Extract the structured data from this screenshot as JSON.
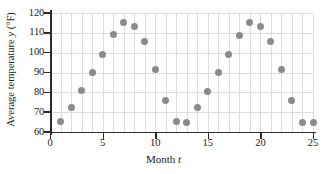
{
  "chart_data": {
    "type": "scatter",
    "title": "",
    "xlabel": "Month t",
    "ylabel": "Average temperature y (°F)",
    "xlim": [
      0,
      25
    ],
    "ylim": [
      60,
      120
    ],
    "xticks": [
      0,
      5,
      10,
      15,
      20,
      25
    ],
    "yticks": [
      60,
      70,
      80,
      90,
      100,
      110,
      120
    ],
    "grid": true,
    "legend": false,
    "marker_color": "#8a8a8f",
    "x": [
      1,
      2,
      3,
      4,
      5,
      6,
      7,
      8,
      9,
      10,
      11,
      12,
      13,
      14,
      15,
      16,
      17,
      18,
      19,
      20,
      21,
      22,
      23,
      24,
      25
    ],
    "y": [
      65.5,
      72.5,
      81,
      90,
      99,
      109,
      115,
      113,
      105.5,
      91.5,
      76,
      65.5,
      65,
      72.5,
      80.5,
      90,
      99,
      108.5,
      115,
      113,
      105.5,
      91.5,
      76,
      65,
      65
    ],
    "points": [
      {
        "x": 1,
        "y": 65.5
      },
      {
        "x": 2,
        "y": 72.5
      },
      {
        "x": 3,
        "y": 81
      },
      {
        "x": 4,
        "y": 90
      },
      {
        "x": 5,
        "y": 99
      },
      {
        "x": 6,
        "y": 109
      },
      {
        "x": 7,
        "y": 115
      },
      {
        "x": 8,
        "y": 113
      },
      {
        "x": 9,
        "y": 105.5
      },
      {
        "x": 10,
        "y": 91.5
      },
      {
        "x": 11,
        "y": 76
      },
      {
        "x": 12,
        "y": 65.5
      },
      {
        "x": 13,
        "y": 65
      },
      {
        "x": 14,
        "y": 72.5
      },
      {
        "x": 15,
        "y": 80.5
      },
      {
        "x": 16,
        "y": 90
      },
      {
        "x": 17,
        "y": 99
      },
      {
        "x": 18,
        "y": 108.5
      },
      {
        "x": 19,
        "y": 115
      },
      {
        "x": 20,
        "y": 113
      },
      {
        "x": 21,
        "y": 105.5
      },
      {
        "x": 22,
        "y": 91.5
      },
      {
        "x": 23,
        "y": 76
      },
      {
        "x": 24,
        "y": 65
      },
      {
        "x": 25,
        "y": 65
      }
    ]
  },
  "axis": {
    "x_title_text": "Month ",
    "x_title_var": "t",
    "y_title_pre": "Average temperature ",
    "y_title_var": "y",
    "y_title_post": " (°F)"
  }
}
